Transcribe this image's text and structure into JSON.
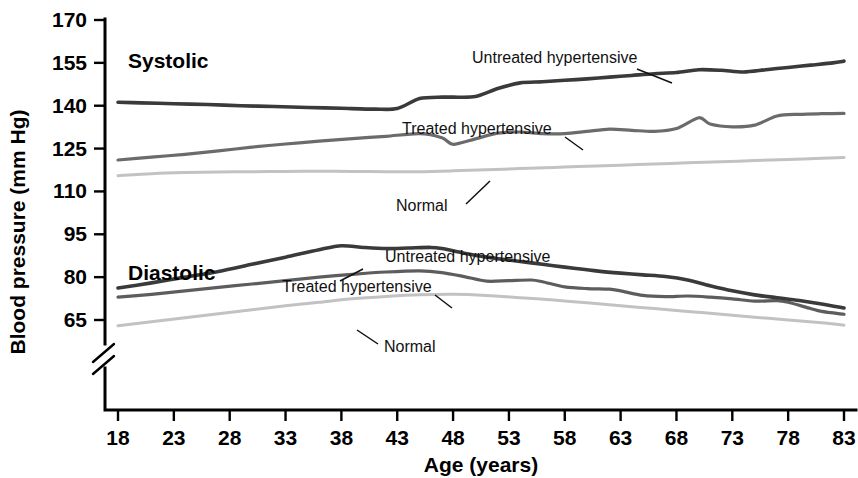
{
  "chart_data": {
    "type": "line",
    "title": "",
    "xlabel": "Age (years)",
    "ylabel": "Blood pressure (mm Hg)",
    "xlim": [
      18,
      83
    ],
    "ylim": [
      58,
      170
    ],
    "xticks": [
      18,
      23,
      28,
      33,
      38,
      43,
      48,
      53,
      58,
      63,
      68,
      73,
      78,
      83
    ],
    "yticks": [
      65,
      80,
      95,
      110,
      125,
      140,
      155,
      170
    ],
    "grid": false,
    "legend_position": "inline-callouts",
    "axis_break": true,
    "axis_break_note": "y-axis broken below 65",
    "groups": [
      {
        "name": "Systolic",
        "label": "Systolic",
        "label_x": 38,
        "series": [
          {
            "name": "Untreated hypertensive",
            "color": "#3a3a3a",
            "width": 3.6,
            "x": [
              18,
              20,
              23,
              26,
              29,
              32,
              35,
              38,
              41,
              43,
              45,
              47,
              48,
              50,
              52,
              54,
              56,
              58,
              60,
              62,
              64,
              66,
              68,
              70,
              72,
              74,
              76,
              78,
              80,
              82,
              83
            ],
            "y": [
              141.2,
              141.0,
              140.7,
              140.4,
              140.0,
              139.7,
              139.4,
              139.1,
              138.8,
              139.0,
              142.5,
              143.0,
              143.0,
              143.2,
              146.0,
              148.0,
              148.4,
              148.9,
              149.4,
              150.0,
              150.6,
              151.2,
              151.6,
              152.6,
              152.4,
              151.8,
              152.6,
              153.4,
              154.2,
              155.0,
              155.6
            ]
          },
          {
            "name": "Treated hypertensive",
            "color": "#6b6b6b",
            "width": 3.2,
            "x": [
              18,
              21,
              24,
              27,
              30,
              33,
              36,
              39,
              42,
              45,
              47,
              48,
              50,
              52,
              54,
              56,
              58,
              60,
              62,
              64,
              66,
              68,
              70,
              71,
              73,
              75,
              77,
              79,
              81,
              83
            ],
            "y": [
              121.0,
              122.0,
              123.0,
              124.2,
              125.5,
              126.6,
              127.6,
              128.5,
              129.3,
              130.2,
              128.8,
              126.5,
              128.4,
              130.4,
              130.8,
              130.2,
              130.2,
              131.0,
              131.8,
              131.4,
              131.0,
              132.0,
              135.8,
              133.6,
              132.6,
              133.2,
              136.4,
              137.0,
              137.2,
              137.3
            ]
          },
          {
            "name": "Normal",
            "color": "#c2c2c2",
            "width": 3.0,
            "x": [
              18,
              21,
              24,
              27,
              30,
              33,
              36,
              39,
              42,
              45,
              48,
              51,
              54,
              57,
              60,
              63,
              66,
              69,
              72,
              75,
              78,
              81,
              83
            ],
            "y": [
              115.5,
              116.2,
              116.6,
              116.8,
              116.9,
              117.0,
              117.1,
              117.0,
              116.9,
              116.9,
              117.2,
              117.6,
              118.0,
              118.4,
              118.8,
              119.2,
              119.6,
              120.0,
              120.4,
              120.8,
              121.2,
              121.6,
              121.9
            ]
          }
        ]
      },
      {
        "name": "Diastolic",
        "label": "Diastolic",
        "label_x": 38,
        "series": [
          {
            "name": "Untreated hypertensive",
            "color": "#3a3a3a",
            "width": 3.6,
            "x": [
              18,
              21,
              24,
              27,
              30,
              33,
              36,
              38,
              40,
              42,
              44,
              46,
              47,
              49,
              51,
              53,
              55,
              57,
              59,
              61,
              63,
              65,
              67,
              69,
              71,
              73,
              75,
              77,
              79,
              81,
              83
            ],
            "y": [
              76.2,
              78.0,
              80.0,
              82.0,
              84.5,
              87.0,
              89.6,
              91.0,
              90.4,
              90.0,
              90.2,
              90.4,
              90.0,
              88.4,
              87.0,
              86.0,
              85.0,
              84.0,
              83.0,
              82.1,
              81.4,
              80.8,
              80.2,
              79.0,
              77.0,
              75.2,
              73.8,
              72.8,
              71.8,
              70.6,
              69.2
            ]
          },
          {
            "name": "Treated hypertensive",
            "color": "#5d5d5d",
            "width": 3.2,
            "x": [
              18,
              21,
              24,
              27,
              30,
              33,
              36,
              39,
              42,
              45,
              47,
              49,
              51,
              53,
              55,
              56,
              58,
              60,
              62,
              63,
              65,
              67,
              69,
              71,
              73,
              75,
              77,
              78,
              80,
              81,
              83
            ],
            "y": [
              73.0,
              74.0,
              75.2,
              76.4,
              77.6,
              78.8,
              80.0,
              81.0,
              81.8,
              82.2,
              81.6,
              80.2,
              78.6,
              78.8,
              79.0,
              78.4,
              76.6,
              76.0,
              75.8,
              75.2,
              73.6,
              73.2,
              73.4,
              73.0,
              72.4,
              71.6,
              71.8,
              71.2,
              69.0,
              68.0,
              67.0
            ]
          },
          {
            "name": "Normal",
            "color": "#c2c2c2",
            "width": 3.0,
            "x": [
              18,
              21,
              24,
              27,
              30,
              33,
              36,
              39,
              42,
              45,
              48,
              51,
              54,
              57,
              60,
              63,
              66,
              69,
              72,
              75,
              78,
              81,
              83
            ],
            "y": [
              63.0,
              64.4,
              65.8,
              67.2,
              68.6,
              70.0,
              71.2,
              72.4,
              73.2,
              73.8,
              74.0,
              73.6,
              72.8,
              72.0,
              71.0,
              70.0,
              69.0,
              68.0,
              67.0,
              66.0,
              65.0,
              64.0,
              63.2
            ]
          }
        ]
      }
    ],
    "callouts": [
      {
        "id": "sys-untreated",
        "text": "Untreated hypertensive",
        "text_x": 472,
        "text_y": 63,
        "leader": [
          [
            637,
            69
          ],
          [
            672,
            83
          ]
        ]
      },
      {
        "id": "sys-treated",
        "text": "Treated hypertensive",
        "text_x": 402,
        "text_y": 134,
        "leader": [
          [
            565,
            137
          ],
          [
            583,
            150
          ]
        ]
      },
      {
        "id": "sys-normal",
        "text": "Normal",
        "text_x": 396,
        "text_y": 211,
        "leader": [
          [
            466,
            204
          ],
          [
            490,
            181
          ]
        ]
      },
      {
        "id": "dia-untreated",
        "text": "Untreated hypertensive",
        "text_x": 385,
        "text_y": 262,
        "leader": [
          [
            363,
            269
          ],
          [
            340,
            281
          ]
        ]
      },
      {
        "id": "dia-treated",
        "text": "Treated hypertensive",
        "text_x": 282,
        "text_y": 292,
        "leader": [
          [
            435,
            295
          ],
          [
            452,
            308
          ]
        ]
      },
      {
        "id": "dia-normal",
        "text": "Normal",
        "text_x": 384,
        "text_y": 352,
        "leader": [
          [
            378,
            344
          ],
          [
            357,
            330
          ]
        ]
      }
    ]
  }
}
